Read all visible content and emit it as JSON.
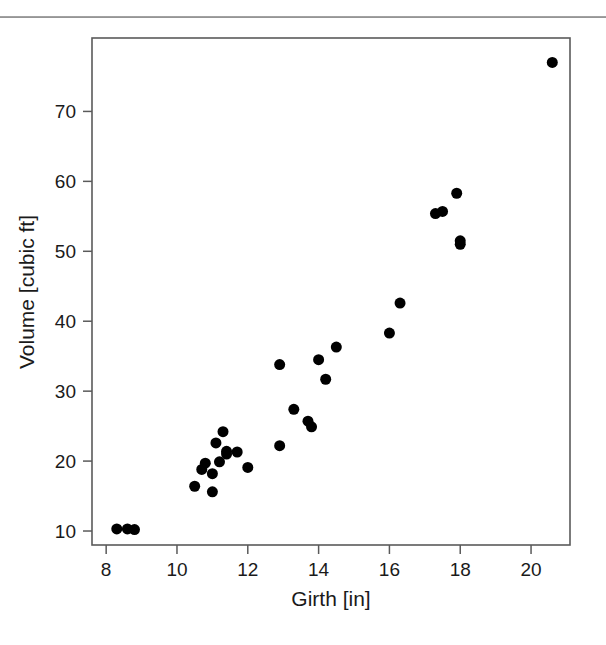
{
  "figure": {
    "background_color": "#ffffff",
    "point_color": "#000000",
    "axis_color": "#5a5a5a",
    "rule_color": "#a0a0a0"
  },
  "axes": {
    "x_title": "Girth [in]",
    "y_title": "Volume [cubic ft]",
    "x_ticks": [
      "8",
      "10",
      "12",
      "14",
      "16",
      "18",
      "20"
    ],
    "y_ticks": [
      "10",
      "20",
      "30",
      "40",
      "50",
      "60",
      "70"
    ]
  },
  "chart_data": {
    "type": "scatter",
    "title": "",
    "xlabel": "Girth [in]",
    "ylabel": "Volume [cubic ft]",
    "xlim": [
      7.6,
      21.1
    ],
    "ylim": [
      8.0,
      80.5
    ],
    "xticks": [
      8,
      10,
      12,
      14,
      16,
      18,
      20
    ],
    "yticks": [
      10,
      20,
      30,
      40,
      50,
      60,
      70
    ],
    "grid": false,
    "legend": null,
    "marker": "filled-circle",
    "marker_size_px": 11,
    "series": [
      {
        "name": "Trees",
        "points": [
          [
            8.3,
            10.3
          ],
          [
            8.6,
            10.3
          ],
          [
            8.8,
            10.2
          ],
          [
            10.5,
            16.4
          ],
          [
            10.7,
            18.8
          ],
          [
            10.8,
            19.7
          ],
          [
            11.0,
            15.6
          ],
          [
            11.0,
            18.2
          ],
          [
            11.1,
            22.6
          ],
          [
            11.2,
            19.9
          ],
          [
            11.3,
            24.2
          ],
          [
            11.4,
            21.0
          ],
          [
            11.4,
            21.4
          ],
          [
            11.7,
            21.3
          ],
          [
            12.0,
            19.1
          ],
          [
            12.9,
            22.2
          ],
          [
            12.9,
            33.8
          ],
          [
            13.3,
            27.4
          ],
          [
            13.7,
            25.7
          ],
          [
            13.8,
            24.9
          ],
          [
            14.0,
            34.5
          ],
          [
            14.2,
            31.7
          ],
          [
            14.5,
            36.3
          ],
          [
            16.0,
            38.3
          ],
          [
            16.3,
            42.6
          ],
          [
            17.3,
            55.4
          ],
          [
            17.5,
            55.7
          ],
          [
            17.9,
            58.3
          ],
          [
            18.0,
            51.5
          ],
          [
            18.0,
            51.0
          ],
          [
            20.6,
            77.0
          ]
        ]
      }
    ]
  }
}
